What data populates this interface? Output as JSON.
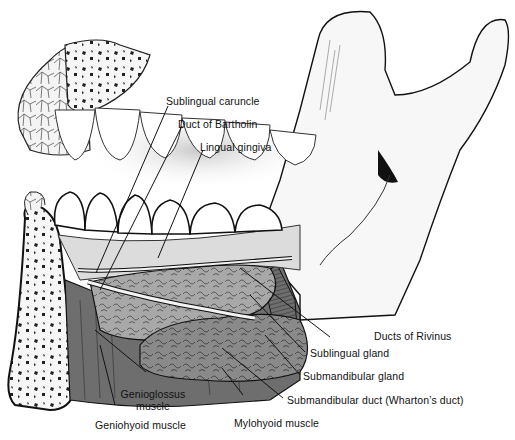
{
  "figure": {
    "colors": {
      "line": "#111111",
      "muscle": "#6e6e6e",
      "muscle_dark": "#4a4a4a",
      "gland": "#a9a9a9",
      "gland_light": "#cfcfcf",
      "bone": "#f4f4f4",
      "gingiva": "#d8d8d8",
      "background": "#ffffff"
    }
  },
  "labels": {
    "sublingual_caruncle": "Sublingual caruncle",
    "duct_of_bartholin": "Duct of Bartholin",
    "lingual_gingiva": "Lingual gingiva",
    "ducts_of_rivinus": "Ducts of Rivinus",
    "sublingual_gland": "Sublingual gland",
    "submandibular_gland": "Submandibular gland",
    "submandibular_duct": "Submandibular duct (Wharton’s duct)",
    "mylohyoid_muscle": "Mylohyoid muscle",
    "genioglossus_muscle_line1": "Genioglossus",
    "genioglossus_muscle_line2": "muscle",
    "geniohyoid_muscle": "Geniohyoid muscle"
  }
}
